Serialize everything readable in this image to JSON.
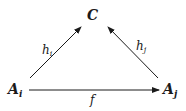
{
  "diagram": {
    "type": "commutative-diagram",
    "nodes": {
      "top": {
        "label": "C"
      },
      "left": {
        "label": "A",
        "subscript": "i"
      },
      "right": {
        "label": "A",
        "subscript": "j"
      }
    },
    "arrows": [
      {
        "from": "left",
        "to": "top",
        "label": "h",
        "subscript": "i"
      },
      {
        "from": "right",
        "to": "top",
        "label": "h",
        "subscript": "j"
      },
      {
        "from": "left",
        "to": "right",
        "label": "f"
      }
    ]
  },
  "colors": {
    "ink": "#1a1a1a",
    "background": "#ffffff"
  }
}
